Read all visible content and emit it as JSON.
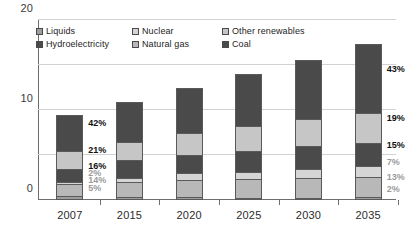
{
  "chart_data": {
    "type": "bar",
    "subtype": "stacked-vertical",
    "title": "",
    "subtitle": "",
    "xlabel": "",
    "ylabel": "",
    "categories": [
      "2007",
      "2015",
      "2020",
      "2025",
      "2030",
      "2035"
    ],
    "ylim": [
      0,
      40
    ],
    "yticks": [
      0,
      10,
      20,
      30,
      40
    ],
    "ytick_labels": [
      "0",
      "10",
      "20",
      "30",
      "40"
    ],
    "grid": true,
    "legend_position": "top-inside",
    "stack_order_bottom_to_top": [
      "Liquids",
      "Natural gas",
      "Nuclear",
      "Hydroelectricity",
      "Other renewables",
      "Coal"
    ],
    "series": [
      {
        "name": "Liquids",
        "color": "#9d9d9d",
        "values": [
          0.9,
          0.6,
          0.6,
          0.5,
          0.5,
          0.6
        ],
        "labels": {
          "2007": "5%",
          "2035": "2%"
        }
      },
      {
        "name": "Natural gas",
        "color": "#b8b8b8",
        "values": [
          2.6,
          3.5,
          3.8,
          4.1,
          4.3,
          4.5
        ],
        "labels": {
          "2007": "14%",
          "2035": "13%"
        }
      },
      {
        "name": "Nuclear",
        "color": "#d5d5d5",
        "values": [
          0.4,
          0.9,
          1.5,
          1.7,
          2.1,
          2.4
        ],
        "labels": {
          "2007": "2%",
          "2035": "7%"
        }
      },
      {
        "name": "Hydroelectricity",
        "color": "#4a4a4a",
        "values": [
          3.0,
          3.9,
          4.2,
          4.6,
          5.0,
          5.2
        ],
        "labels": {
          "2007": "16%",
          "2035": "15%"
        }
      },
      {
        "name": "Other renewables",
        "color": "#c6c6c6",
        "values": [
          4.0,
          4.0,
          4.8,
          5.5,
          6.0,
          6.6
        ],
        "labels": {
          "2007": "21%",
          "2035": "19%"
        }
      },
      {
        "name": "Coal",
        "color": "#4a4a4a",
        "values": [
          7.9,
          8.8,
          9.9,
          11.6,
          13.2,
          15.3
        ],
        "labels": {
          "2007": "42%",
          "2035": "43%"
        }
      }
    ],
    "totals": [
      18.8,
      21.7,
      24.8,
      28.0,
      31.1,
      34.6
    ],
    "annotations": [
      {
        "category": "2007",
        "series": "Coal",
        "text": "42%",
        "emphasis": "dark"
      },
      {
        "category": "2007",
        "series": "Other renewables",
        "text": "21%",
        "emphasis": "dark"
      },
      {
        "category": "2007",
        "series": "Hydroelectricity",
        "text": "16%",
        "emphasis": "dark"
      },
      {
        "category": "2007",
        "series": "Nuclear",
        "text": "2%",
        "emphasis": "muted"
      },
      {
        "category": "2007",
        "series": "Natural gas",
        "text": "14%",
        "emphasis": "muted"
      },
      {
        "category": "2007",
        "series": "Liquids",
        "text": "5%",
        "emphasis": "muted"
      },
      {
        "category": "2035",
        "series": "Coal",
        "text": "43%",
        "emphasis": "dark"
      },
      {
        "category": "2035",
        "series": "Other renewables",
        "text": "19%",
        "emphasis": "dark"
      },
      {
        "category": "2035",
        "series": "Hydroelectricity",
        "text": "15%",
        "emphasis": "dark"
      },
      {
        "category": "2035",
        "series": "Nuclear",
        "text": "7%",
        "emphasis": "muted"
      },
      {
        "category": "2035",
        "series": "Natural gas",
        "text": "13%",
        "emphasis": "muted"
      },
      {
        "category": "2035",
        "series": "Liquids",
        "text": "2%",
        "emphasis": "muted"
      }
    ]
  },
  "legend": {
    "items": [
      {
        "label": "Liquids",
        "color": "#9d9d9d"
      },
      {
        "label": "Nuclear",
        "color": "#d5d5d5"
      },
      {
        "label": "Other renewables",
        "color": "#c6c6c6"
      },
      {
        "label": "Hydroelectricity",
        "color": "#4a4a4a"
      },
      {
        "label": "Natural gas",
        "color": "#b8b8b8"
      },
      {
        "label": "Coal",
        "color": "#4a4a4a"
      }
    ]
  },
  "axes": {
    "y": {
      "labels": [
        "0",
        "10",
        "20",
        "30",
        "40"
      ]
    },
    "x": {
      "labels": [
        "2007",
        "2015",
        "2020",
        "2025",
        "2030",
        "2035"
      ]
    }
  },
  "colors": {
    "gridline": "#d2d2d2",
    "axis": "#6e6e6e",
    "label_dark": "#111111",
    "label_muted": "#9b9b9b",
    "background": "#ffffff"
  }
}
